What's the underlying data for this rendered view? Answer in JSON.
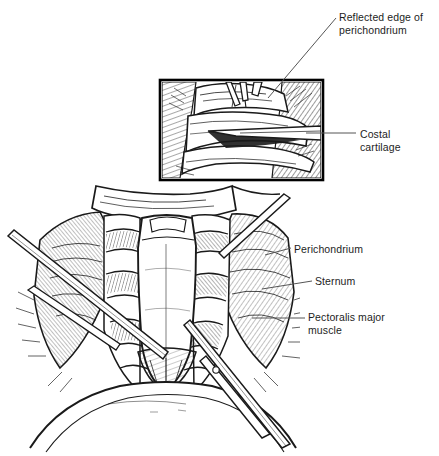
{
  "figure": {
    "background_color": "#ffffff",
    "ink_color": "#1a1a1a",
    "style": "pen-and-ink medical line illustration with cross-hatching",
    "inset": {
      "present": true,
      "border_color": "#000000",
      "x": 160,
      "y": 80,
      "width": 163,
      "height": 100,
      "description": "magnified detail of costal cartilage with periosteal elevator beneath reflected perichondrium"
    }
  },
  "labels": [
    {
      "id": "reflected-edge",
      "text": "Reflected edge of\nperichondrium",
      "x": 339,
      "y": 11,
      "leader": {
        "type": "diagonal",
        "x1": 268,
        "y1": 98,
        "x2": 336,
        "y2": 18
      }
    },
    {
      "id": "costal-cartilage",
      "text": "Costal\ncartilage",
      "x": 360,
      "y": 128,
      "leader": {
        "type": "horizontal",
        "x1": 306,
        "y1": 133,
        "x2": 356,
        "y2": 133
      }
    },
    {
      "id": "perichondrium",
      "text": "Perichondrium",
      "x": 294,
      "y": 243,
      "leader": {
        "type": "diagonal",
        "x1": 265,
        "y1": 255,
        "x2": 291,
        "y2": 248
      }
    },
    {
      "id": "sternum",
      "text": "Sternum",
      "x": 315,
      "y": 275,
      "leader": {
        "type": "diagonal",
        "x1": 262,
        "y1": 289,
        "x2": 312,
        "y2": 281
      }
    },
    {
      "id": "pectoralis-major",
      "text": "Pectoralis major\nmuscle",
      "x": 308,
      "y": 311,
      "leader": {
        "type": "horizontal",
        "x1": 252,
        "y1": 318,
        "x2": 305,
        "y2": 318
      }
    }
  ],
  "anatomy": {
    "structures": [
      "sternum",
      "costal cartilage",
      "perichondrium",
      "pectoralis major muscle",
      "ribs",
      "xiphoid"
    ]
  },
  "instruments": {
    "items": [
      "periosteal elevator",
      "retractor",
      "dissector"
    ]
  }
}
